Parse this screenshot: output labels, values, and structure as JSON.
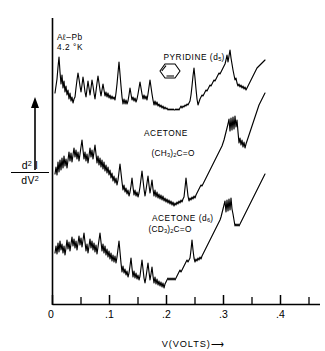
{
  "figure": {
    "junction_label_line1": "Aℓ–Pb",
    "junction_label_line2": "4.2 °K",
    "y_axis_numerator": "d² I",
    "y_axis_denominator": "dV²",
    "x_axis_label": "V(VOLTS)",
    "x_axis_arrow": "⟶",
    "ink_color": "#000000",
    "background_color": "#ffffff"
  },
  "chart_data": {
    "type": "line",
    "title": "",
    "subtitle": "",
    "xlabel": "V(VOLTS)",
    "ylabel": "d²I/dV²",
    "xlim": [
      0.0,
      0.46
    ],
    "ylim": [
      0.0,
      1.0
    ],
    "grid": false,
    "legend_position": "inline-annotations",
    "x_ticks_major": [
      0.0,
      0.1,
      0.2,
      0.3,
      0.4
    ],
    "x_tick_labels": [
      "0",
      ".1",
      ".2",
      ".3",
      ".4"
    ],
    "x_ticks_minor": [
      0.05,
      0.15,
      0.25,
      0.35,
      0.45
    ],
    "y_ticks": [],
    "y_axis_note": "arbitrary units, traces vertically offset",
    "annotations": [
      {
        "name": "junction",
        "text": "Aℓ–Pb  4.2 °K",
        "x": 0.015,
        "y": 0.93
      },
      {
        "name": "pyridine-structure",
        "text": "pyridine ring with N",
        "x": 0.2,
        "y": 0.8
      }
    ],
    "series": [
      {
        "name": "PYRIDINE (d5)",
        "label_line1": "PYRIDINE (d",
        "label_sub": "5",
        "label_line2": ")",
        "offset": "top",
        "points_px": "55,93 57,79 58,67 59,57 60,72 61,84 62,75 63,88 64,81 65,92 66,86 67,95 68,90 69,99 70,93 71,101 72,97 73,103 74,99 75,97 76,88 77,80 78,73 79,79 80,86 81,92 82,85 83,77 84,84 85,92 86,97 87,89 88,81 89,88 90,95 91,88 92,80 93,86 94,93 95,99 96,91 97,83 98,76 99,83 100,90 101,96 102,90 103,84 104,90 105,96 106,92 107,97 108,93 109,98 110,95 111,99 112,96 113,99 114,97 115,100 116,93 117,84 118,73 119,62 120,74 121,86 122,97 123,104 124,99 125,104 126,100 127,104 128,101 129,95 130,88 131,94 132,100 133,97 134,101 135,98 136,102 137,99 138,94 139,88 140,82 141,88 142,94 143,99 144,95 145,99 146,96 147,100 148,94 149,87 150,80 151,87 152,94 153,100 154,105 155,101 156,105 157,102 158,106 159,104 160,107 161,105 162,108 163,106 164,109 165,107 166,109 167,108 168,110 169,109 170,110 171,109 172,110 173,109 174,110 175,110 176,109 177,110 178,109 179,110 180,108 181,106 182,108 183,106 184,107 185,105 186,106 187,104 188,105 189,103 190,101 191,95 192,86 193,76 194,68 195,78 196,89 197,99 198,105 199,102 200,99 201,97 202,95 203,96 204,94 205,92 206,90 207,91 208,89 209,87 210,85 211,86 212,84 213,82 214,80 215,81 216,79 217,77 218,75 219,73 220,74 221,72 222,70 223,68 224,66 225,64 226,60 227,55 228,62 229,56 230,50 231,58 232,64 233,70 234,75 235,80 236,78 237,83 238,86 239,84 240,87 241,85 242,88 243,86 244,89 245,87 246,90 247,88 248,86 249,84 250,82 251,80 252,78 253,76 254,74 255,72 256,70 257,68 258,67 259,66 260,65 261,64 262,63 263,62 264,61 265,60"
      },
      {
        "name": "ACETONE (CH3)2C=O",
        "label_line1": "ACETONE",
        "label_line2": "(CH",
        "label_sub1": "3",
        "label_mid": ")",
        "label_sub2": "2",
        "label_line2b": "C=O",
        "offset": "middle",
        "points_px": "55,174 56,167 57,175 58,162 59,172 60,160 61,170 62,158 63,168 64,156 65,166 66,159 67,168 68,160 69,152 70,161 71,153 72,162 73,155 74,148 75,157 76,150 77,159 78,152 79,161 80,154 81,147 82,140 83,150 84,159 85,152 86,161 87,154 88,163 89,156 90,148 91,157 92,150 93,159 94,152 95,145 96,154 97,163 98,156 99,165 100,158 101,167 102,160 103,169 104,162 105,171 106,165 107,173 108,167 109,175 110,170 111,178 112,173 113,181 114,176 115,183 116,178 117,185 118,180 119,172 120,164 121,173 122,182 123,190 124,185 125,192 126,188 127,194 128,190 129,196 130,192 131,186 132,178 133,187 134,195 135,190 136,196 137,192 138,197 139,193 140,187 141,179 142,171 143,180 144,189 145,196 146,190 147,183 148,176 149,185 150,193 151,187 152,180 153,189 154,196 155,190 156,197 157,192 158,198 159,194 160,199 161,195 162,200 163,196 164,201 165,198 166,202 167,199 168,203 169,200 170,204 171,201 172,205 173,202 174,206 175,203 176,205 177,202 178,204 179,201 180,203 181,200 182,202 183,199 184,197 185,188 186,178 187,187 188,196 189,201 190,198 191,200 192,197 193,199 194,196 195,198 196,195 197,193 198,191 199,189 200,187 201,185 202,186 203,184 204,182 205,180 206,178 207,176 208,174 209,172 210,170 211,168 212,166 213,164 214,162 215,160 216,158 217,156 218,154 219,152 220,150 221,148 222,146 223,143 224,140 225,136 226,132 227,128 228,124 229,119 230,131 231,118 232,130 233,117 234,129 235,116 236,127 237,120 238,132 239,143 240,138 241,145 242,140 243,147 244,142 245,148 246,144 247,141 248,138 249,135 250,132 251,129 252,126 253,123 254,120 255,117 256,114 257,111 258,108 259,105 260,103 261,101 262,99 263,97 264,95 265,93"
      },
      {
        "name": "ACETONE (d6) (CD3)2C=O",
        "label_line1": "ACETONE (d",
        "label_sub": "6",
        "label_line1b": ")",
        "label_line2": "(CD",
        "label_sub1": "3",
        "label_mid": ")",
        "label_sub2": "2",
        "label_line2b": "C=O",
        "offset": "bottom",
        "points_px": "55,253 56,246 57,254 58,243 59,252 60,241 61,250 62,244 63,253 64,246 65,255 66,248 67,240 68,249 69,242 70,251 71,244 72,237 73,246 74,239 75,248 76,241 77,250 78,243 79,236 80,245 81,238 82,247 83,240 84,233 85,242 86,251 87,244 88,253 89,246 90,239 91,248 92,241 93,250 94,243 95,252 96,245 97,254 98,247 99,240 100,233 101,242 102,251 103,244 104,253 105,246 106,255 107,249 108,257 109,251 110,259 111,253 112,261 113,255 114,262 115,256 116,263 117,257 118,249 119,241 120,252 121,263 122,272 123,266 124,273 125,269 126,275 127,271 128,277 129,273 130,266 131,258 132,268 133,277 134,271 135,278 136,273 137,279 138,275 139,280 140,276 141,268 142,260 143,269 144,278 145,283 146,277 147,270 148,263 149,272 150,280 151,274 152,267 153,276 154,283 155,277 156,284 157,279 158,285 159,281 160,286 161,282 162,287 163,283 164,288 165,284 166,282 167,280 168,278 169,280 170,278 171,280 172,278 173,280 174,278 175,280 176,278 177,276 178,274 179,272 180,270 181,272 182,270 183,268 184,266 185,264 186,262 187,260 188,262 189,260 190,258 191,250 192,240 193,250 194,258 195,262 196,259 197,261 198,258 199,260 200,257 201,259 202,256 203,254 204,252 205,250 206,248 207,246 208,244 209,242 210,240 211,238 212,236 213,234 214,232 215,230 216,228 217,226 218,224 219,222 220,220 221,217 222,213 223,209 224,205 225,201 226,212 227,200 228,211 229,199 230,210 231,198 232,209 233,214 234,220 235,226 236,224 237,226 238,224 239,226 240,224 241,222 242,220 243,218 244,216 245,214 246,212 247,210 248,208 249,206 250,204 251,202 252,200 253,198 254,196 255,194 256,192 257,190 258,188 259,186 260,184 261,182 262,180 263,178 264,176 265,174"
      }
    ]
  }
}
